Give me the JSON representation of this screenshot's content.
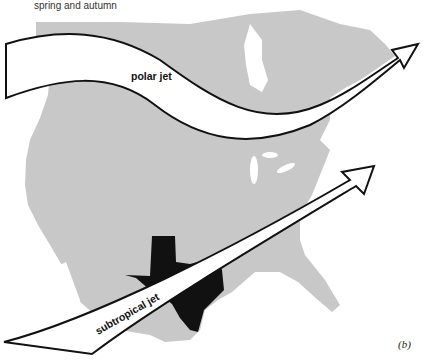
{
  "figure": {
    "caption": "spring and autumn",
    "panel_label": "(b)",
    "colors": {
      "land": "#c8c8c8",
      "texas": "#111111",
      "jet_fill": "#ffffff",
      "jet_outline": "#111111"
    },
    "jets": [
      {
        "name": "polar-jet",
        "label": "polar jet"
      },
      {
        "name": "subtropical-jet",
        "label": "subtropical jet"
      }
    ],
    "highlighted_region": "Texas"
  }
}
